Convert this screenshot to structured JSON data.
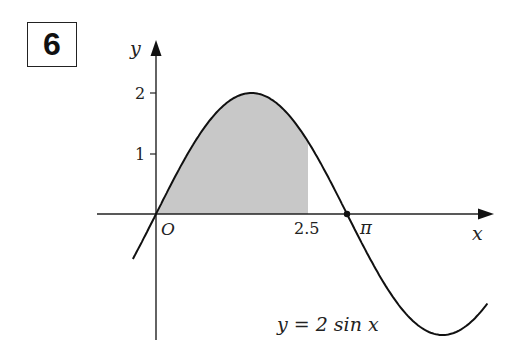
{
  "question": {
    "number": "6"
  },
  "chart_data": {
    "type": "line",
    "title": "",
    "function": "y = 2 sin x",
    "xlabel": "x",
    "ylabel": "y",
    "origin_label": "O",
    "x_tick_labels": [
      "2.5",
      "π"
    ],
    "y_tick_labels": [
      "1",
      "2"
    ],
    "y_ticks": [
      1,
      2
    ],
    "x_marks": [
      2.5,
      3.14159
    ],
    "xlim": [
      -0.38,
      5.45
    ],
    "ylim": [
      -2.0,
      2.8
    ],
    "shaded_region": {
      "from": 0,
      "to": 2.5,
      "description": "area under curve between x=0 and x=2.5"
    },
    "points": [
      {
        "x": 3.14159,
        "y": 0,
        "label": "π",
        "marker": "dot"
      }
    ],
    "curve_label": "y = 2 sin x",
    "grid": false,
    "colors": {
      "curve": "#111111",
      "shade": "#c8c8c8",
      "axis": "#222222"
    }
  },
  "labels": {
    "y_axis": "y",
    "x_axis": "x",
    "origin": "O",
    "y1": "1",
    "y2": "2",
    "x25": "2.5",
    "xpi": "π",
    "curve": "y = 2 sin x"
  }
}
